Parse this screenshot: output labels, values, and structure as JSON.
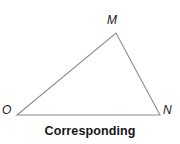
{
  "figure": {
    "type": "geometry-diagram",
    "shape": "triangle",
    "background_color": "#ffffff",
    "stroke_color": "#8c8c8c",
    "stroke_width": 1.1,
    "label_color": "#1a1a1a",
    "caption_color": "#161616",
    "vertices": [
      {
        "name": "M",
        "label": "M",
        "x": 116,
        "y": 33,
        "label_x": 107,
        "label_y": 14,
        "position": "apex"
      },
      {
        "name": "O",
        "label": "O",
        "x": 17,
        "y": 115,
        "label_x": 2,
        "label_y": 104,
        "position": "bottom-left"
      },
      {
        "name": "N",
        "label": "N",
        "x": 160,
        "y": 115,
        "label_x": 163,
        "label_y": 104,
        "position": "bottom-right"
      }
    ],
    "edges": [
      {
        "name": "edge-OM",
        "from": "O",
        "to": "M"
      },
      {
        "name": "edge-MN",
        "from": "M",
        "to": "N"
      },
      {
        "name": "edge-ON",
        "from": "O",
        "to": "N"
      }
    ],
    "polygon_points": "17,115 116,33 160,115"
  },
  "caption": {
    "text": "Corresponding"
  }
}
